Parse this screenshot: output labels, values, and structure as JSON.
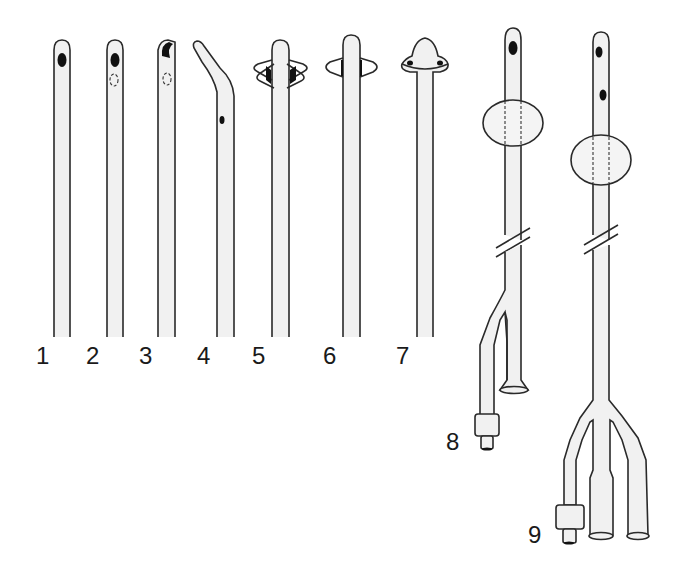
{
  "figure": {
    "type": "catheter tip and design illustration",
    "items": [
      {
        "id": "1",
        "label": "1",
        "description": "straight catheter, single end-side hole"
      },
      {
        "id": "2",
        "label": "2",
        "description": "straight catheter, eye with opposite hidden eye (dashed)"
      },
      {
        "id": "3",
        "label": "3",
        "description": "open-ended whistle tip catheter"
      },
      {
        "id": "4",
        "label": "4",
        "description": "coudé (curved) tip catheter"
      },
      {
        "id": "5",
        "label": "5",
        "description": "Malecot catheter, four wings"
      },
      {
        "id": "6",
        "label": "6",
        "description": "Malecot catheter, two wings"
      },
      {
        "id": "7",
        "label": "7",
        "description": "de Pezzer (mushroom) catheter"
      },
      {
        "id": "8",
        "label": "8",
        "description": "two-way Foley balloon catheter"
      },
      {
        "id": "9",
        "label": "9",
        "description": "three-way Foley balloon catheter"
      }
    ]
  },
  "colors": {
    "background": "#ffffff",
    "outline": "#2a2a2a",
    "tube_fill": "#f1f1f1",
    "hole": "#111111"
  }
}
